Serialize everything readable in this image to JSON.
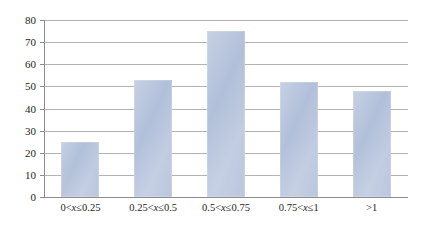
{
  "chart_data": {
    "type": "bar",
    "title": "",
    "subtitle": "",
    "xlabel": "",
    "ylabel": "",
    "categories": [
      "0<x≤0.25",
      "0.25<x≤0.5",
      "0.5<x≤0.75",
      "0.75<x≤1",
      ">1"
    ],
    "category_parts": [
      {
        "pre": "0<",
        "var": "x",
        "post": "≤0.25"
      },
      {
        "pre": "0.25<",
        "var": "x",
        "post": "≤0.5"
      },
      {
        "pre": "0.5<",
        "var": "x",
        "post": "≤0.75"
      },
      {
        "pre": "0.75<",
        "var": "x",
        "post": "≤1"
      },
      {
        "pre": ">1",
        "var": "",
        "post": ""
      }
    ],
    "values": [
      25,
      53,
      75,
      52,
      48
    ],
    "ylim": [
      0,
      80
    ],
    "ytick_step": 10,
    "ytick_labels": [
      "0",
      "10",
      "20",
      "30",
      "40",
      "50",
      "60",
      "70",
      "80"
    ],
    "grid": true,
    "grid_axis": "y",
    "legend": false,
    "legend_position": "none",
    "bar_color": "#aebdd8",
    "grid_color": "#9a9a9a",
    "axis_color": "#8c8c8c",
    "text_color": "#231f20",
    "background": "#ffffff"
  }
}
